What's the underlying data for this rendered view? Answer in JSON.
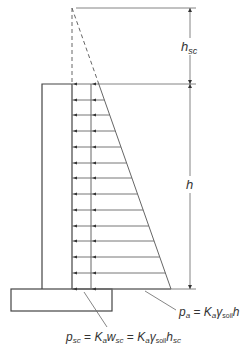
{
  "diagram": {
    "labels": {
      "hsc": {
        "main": "h",
        "sub": "sc"
      },
      "h": {
        "main": "h"
      },
      "pa": {
        "p": "p",
        "p_sub": "a",
        "eq": " = ",
        "K": "K",
        "K_sub": "a",
        "gamma": "γ",
        "gamma_sub": "soil",
        "tail": "h"
      },
      "psc": {
        "p": "p",
        "p_sub": "sc",
        "eq1": " = ",
        "K1": "K",
        "K1_sub": "a",
        "w": "w",
        "w_sub": "sc",
        "eq2": " = ",
        "K2": "K",
        "K2_sub": "a",
        "gamma": "γ",
        "gamma_sub": "soil",
        "h": "h",
        "h_sub": "sc"
      }
    },
    "geometry": {
      "apex": [
        72,
        8
      ],
      "wall": {
        "left": 42,
        "right": 72,
        "top": 84,
        "bottom": 289
      },
      "footing": {
        "left": 11,
        "right": 112,
        "top": 289,
        "bottom": 311
      },
      "surcharge_line_x": 91,
      "triangle_base_right": [
        171,
        289
      ],
      "arrow_rows_y": [
        84,
        100,
        115,
        131,
        147,
        163,
        178,
        194,
        210,
        226,
        241,
        257,
        273,
        289
      ],
      "dimension_x": 190
    },
    "colors": {
      "line": "#444444",
      "thin": "#666666"
    }
  }
}
